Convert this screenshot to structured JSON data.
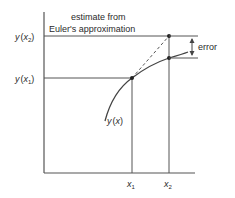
{
  "diagram": {
    "annotation": {
      "line1": "estimate from",
      "line2": "Euler's approximation"
    },
    "y_labels": {
      "y_x2": {
        "y": "y",
        "open": "(",
        "var": "x",
        "sub": "2",
        "close": ")"
      },
      "y_x1": {
        "y": "y",
        "open": "(",
        "var": "x",
        "sub": "1",
        "close": ")"
      }
    },
    "x_labels": {
      "x1": {
        "var": "x",
        "sub": "1"
      },
      "x2": {
        "var": "x",
        "sub": "2"
      }
    },
    "curve_label": {
      "y": "y",
      "open": "(",
      "var": "x",
      "close": ")"
    },
    "error_label": "error",
    "colors": {
      "line": "#555555",
      "text": "#2a2a2a",
      "background": "#ffffff"
    }
  }
}
